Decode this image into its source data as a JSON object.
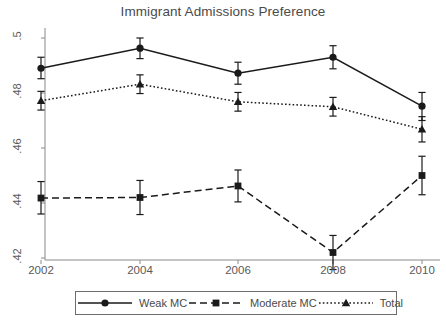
{
  "chart_data": {
    "type": "line",
    "title": "Immigrant Admissions Preference",
    "xlabel": "",
    "ylabel": "",
    "x": [
      2002,
      2004,
      2006,
      2008,
      2010
    ],
    "categories": [
      "2002",
      "2004",
      "2006",
      "2008",
      "2010"
    ],
    "xtick_labels": [
      "2002",
      "2004",
      "2006",
      "2008",
      "2010"
    ],
    "ytick_labels": [
      ".5",
      ".48",
      ".46",
      ".44",
      ".42"
    ],
    "ytick_values": [
      0.5,
      0.48,
      0.46,
      0.44,
      0.42
    ],
    "ylim": [
      0.41,
      0.505
    ],
    "xlim": [
      2001.2,
      2010.6
    ],
    "grid": false,
    "legend_position": "bottom",
    "error_bars": true,
    "series": [
      {
        "name": "Weak MC",
        "line_style": "solid",
        "marker": "circle",
        "color": "#1a1a1a",
        "values": [
          0.489,
          0.4963,
          0.4872,
          0.493,
          0.4752
        ],
        "err_low": [
          0.4852,
          0.4925,
          0.4832,
          0.4888,
          0.47
        ],
        "err_high": [
          0.493,
          0.5,
          0.4912,
          0.4972,
          0.4802
        ]
      },
      {
        "name": "Moderate MC",
        "line_style": "dashed",
        "marker": "square",
        "color": "#1a1a1a",
        "values": [
          0.4418,
          0.442,
          0.4462,
          0.422,
          0.45
        ],
        "err_low": [
          0.436,
          0.4358,
          0.4404,
          0.4158,
          0.443
        ],
        "err_high": [
          0.4478,
          0.4482,
          0.452,
          0.4282,
          0.457
        ]
      },
      {
        "name": "Total",
        "line_style": "dotted",
        "marker": "triangle",
        "color": "#1a1a1a",
        "values": [
          0.4772,
          0.4832,
          0.4768,
          0.475,
          0.4668
        ],
        "err_low": [
          0.4738,
          0.4798,
          0.4734,
          0.4716,
          0.4622
        ],
        "err_high": [
          0.4806,
          0.4866,
          0.4802,
          0.4784,
          0.4714
        ]
      }
    ]
  },
  "legend": {
    "items": [
      {
        "label": "Weak MC"
      },
      {
        "label": "Moderate MC"
      },
      {
        "label": "Total"
      }
    ]
  }
}
